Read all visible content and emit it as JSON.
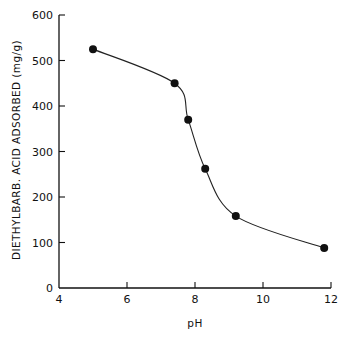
{
  "chart_data": {
    "type": "line",
    "title": "",
    "xlabel": "pH",
    "ylabel": "DIETHYLBARB. ACID ADSORBED (mg/g)",
    "xlim": [
      4,
      12
    ],
    "ylim": [
      0,
      600
    ],
    "xticks": [
      4,
      6,
      8,
      10,
      12
    ],
    "yticks": [
      0,
      100,
      200,
      300,
      400,
      500,
      600
    ],
    "grid": false,
    "legend": "none",
    "series": [
      {
        "name": "adsorption",
        "x": [
          5.0,
          7.4,
          7.8,
          8.3,
          9.2,
          11.8
        ],
        "y": [
          525,
          450,
          370,
          262,
          158,
          88
        ],
        "marker": "filled-circle",
        "line": "smooth",
        "color": "#111111"
      }
    ]
  }
}
